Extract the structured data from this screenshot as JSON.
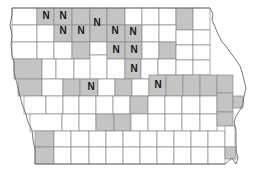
{
  "map": {
    "subject": "Iowa counties",
    "label_text": "N",
    "colors": {
      "shaded": "#c4c4c4",
      "unshaded": "#ffffff",
      "border": "#8a8a8a",
      "label": "#1a1a1a"
    },
    "counties": [
      {
        "x": 12,
        "y": 8,
        "w": 25,
        "h": 17,
        "shaded": false
      },
      {
        "x": 37,
        "y": 8,
        "w": 17,
        "h": 17,
        "shaded": true,
        "label": "N"
      },
      {
        "x": 54,
        "y": 8,
        "w": 18,
        "h": 17,
        "shaded": true,
        "label": "N"
      },
      {
        "x": 72,
        "y": 8,
        "w": 18,
        "h": 17,
        "shaded": true
      },
      {
        "x": 90,
        "y": 8,
        "w": 17,
        "h": 17,
        "shaded": true
      },
      {
        "x": 107,
        "y": 8,
        "w": 18,
        "h": 17,
        "shaded": true
      },
      {
        "x": 125,
        "y": 8,
        "w": 17,
        "h": 17,
        "shaded": false
      },
      {
        "x": 142,
        "y": 8,
        "w": 17,
        "h": 17,
        "shaded": false
      },
      {
        "x": 159,
        "y": 8,
        "w": 17,
        "h": 17,
        "shaded": false
      },
      {
        "x": 176,
        "y": 8,
        "w": 17,
        "h": 22,
        "shaded": true
      },
      {
        "x": 193,
        "y": 8,
        "w": 17,
        "h": 22,
        "shaded": false
      },
      {
        "x": 12,
        "y": 25,
        "w": 25,
        "h": 17,
        "shaded": false
      },
      {
        "x": 37,
        "y": 25,
        "w": 17,
        "h": 17,
        "shaded": false
      },
      {
        "x": 54,
        "y": 25,
        "w": 18,
        "h": 17,
        "shaded": true,
        "label": "N"
      },
      {
        "x": 72,
        "y": 25,
        "w": 18,
        "h": 17,
        "shaded": true,
        "label": "N"
      },
      {
        "x": 90,
        "y": 25,
        "w": 17,
        "h": 17,
        "shaded": true
      },
      {
        "x": 107,
        "y": 25,
        "w": 18,
        "h": 17,
        "shaded": true,
        "label": "N"
      },
      {
        "x": 125,
        "y": 25,
        "w": 17,
        "h": 17,
        "shaded": true,
        "label": "N"
      },
      {
        "x": 142,
        "y": 25,
        "w": 17,
        "h": 17,
        "shaded": false
      },
      {
        "x": 159,
        "y": 25,
        "w": 17,
        "h": 17,
        "shaded": false
      },
      {
        "x": 176,
        "y": 30,
        "w": 17,
        "h": 15,
        "shaded": false
      },
      {
        "x": 193,
        "y": 30,
        "w": 17,
        "h": 15,
        "shaded": false
      },
      {
        "x": 12,
        "y": 42,
        "w": 25,
        "h": 17,
        "shaded": false
      },
      {
        "x": 37,
        "y": 42,
        "w": 17,
        "h": 17,
        "shaded": false
      },
      {
        "x": 54,
        "y": 42,
        "w": 18,
        "h": 17,
        "shaded": false
      },
      {
        "x": 72,
        "y": 42,
        "w": 18,
        "h": 17,
        "shaded": true
      },
      {
        "x": 90,
        "y": 42,
        "w": 17,
        "h": 13,
        "shaded": false
      },
      {
        "x": 107,
        "y": 42,
        "w": 18,
        "h": 17,
        "shaded": true
      },
      {
        "x": 125,
        "y": 42,
        "w": 17,
        "h": 17,
        "shaded": true,
        "label": "N"
      },
      {
        "x": 142,
        "y": 42,
        "w": 17,
        "h": 17,
        "shaded": false
      },
      {
        "x": 159,
        "y": 42,
        "w": 17,
        "h": 17,
        "shaded": true
      },
      {
        "x": 176,
        "y": 45,
        "w": 17,
        "h": 15,
        "shaded": false
      },
      {
        "x": 193,
        "y": 45,
        "w": 17,
        "h": 15,
        "shaded": false
      },
      {
        "x": 14,
        "y": 59,
        "w": 28,
        "h": 20,
        "shaded": true
      },
      {
        "x": 42,
        "y": 59,
        "w": 14,
        "h": 20,
        "shaded": false
      },
      {
        "x": 56,
        "y": 59,
        "w": 18,
        "h": 20,
        "shaded": false
      },
      {
        "x": 74,
        "y": 59,
        "w": 17,
        "h": 20,
        "shaded": false
      },
      {
        "x": 90,
        "y": 55,
        "w": 17,
        "h": 24,
        "shaded": false
      },
      {
        "x": 107,
        "y": 59,
        "w": 18,
        "h": 20,
        "shaded": false
      },
      {
        "x": 125,
        "y": 59,
        "w": 16,
        "h": 20,
        "shaded": true,
        "label": "N"
      },
      {
        "x": 141,
        "y": 59,
        "w": 17,
        "h": 20,
        "shaded": false
      },
      {
        "x": 158,
        "y": 59,
        "w": 18,
        "h": 16,
        "shaded": false
      },
      {
        "x": 176,
        "y": 60,
        "w": 17,
        "h": 15,
        "shaded": false
      },
      {
        "x": 193,
        "y": 60,
        "w": 17,
        "h": 15,
        "shaded": false
      },
      {
        "x": 18,
        "y": 79,
        "w": 24,
        "h": 17,
        "shaded": true
      },
      {
        "x": 42,
        "y": 79,
        "w": 21,
        "h": 17,
        "shaded": false
      },
      {
        "x": 63,
        "y": 79,
        "w": 17,
        "h": 17,
        "shaded": true
      },
      {
        "x": 80,
        "y": 79,
        "w": 18,
        "h": 17,
        "shaded": true,
        "label": "N"
      },
      {
        "x": 98,
        "y": 79,
        "w": 17,
        "h": 17,
        "shaded": false
      },
      {
        "x": 115,
        "y": 79,
        "w": 17,
        "h": 17,
        "shaded": true
      },
      {
        "x": 132,
        "y": 79,
        "w": 17,
        "h": 17,
        "shaded": false
      },
      {
        "x": 149,
        "y": 75,
        "w": 17,
        "h": 21,
        "shaded": true,
        "label": "N"
      },
      {
        "x": 166,
        "y": 75,
        "w": 17,
        "h": 21,
        "shaded": true
      },
      {
        "x": 183,
        "y": 75,
        "w": 17,
        "h": 21,
        "shaded": true
      },
      {
        "x": 200,
        "y": 75,
        "w": 17,
        "h": 21,
        "shaded": true
      },
      {
        "x": 217,
        "y": 75,
        "w": 16,
        "h": 18,
        "shaded": true
      },
      {
        "x": 24,
        "y": 96,
        "w": 22,
        "h": 18,
        "shaded": false
      },
      {
        "x": 46,
        "y": 96,
        "w": 17,
        "h": 18,
        "shaded": false
      },
      {
        "x": 63,
        "y": 96,
        "w": 16,
        "h": 18,
        "shaded": false
      },
      {
        "x": 79,
        "y": 96,
        "w": 17,
        "h": 18,
        "shaded": false
      },
      {
        "x": 96,
        "y": 96,
        "w": 17,
        "h": 18,
        "shaded": false
      },
      {
        "x": 113,
        "y": 96,
        "w": 17,
        "h": 18,
        "shaded": false
      },
      {
        "x": 130,
        "y": 96,
        "w": 18,
        "h": 18,
        "shaded": true
      },
      {
        "x": 148,
        "y": 96,
        "w": 17,
        "h": 18,
        "shaded": false
      },
      {
        "x": 165,
        "y": 96,
        "w": 17,
        "h": 18,
        "shaded": false
      },
      {
        "x": 182,
        "y": 96,
        "w": 18,
        "h": 18,
        "shaded": false
      },
      {
        "x": 200,
        "y": 96,
        "w": 17,
        "h": 18,
        "shaded": false
      },
      {
        "x": 217,
        "y": 93,
        "w": 16,
        "h": 19,
        "shaded": true
      },
      {
        "x": 233,
        "y": 96,
        "w": 10,
        "h": 12,
        "shaded": true
      },
      {
        "x": 30,
        "y": 114,
        "w": 32,
        "h": 17,
        "shaded": false
      },
      {
        "x": 62,
        "y": 114,
        "w": 17,
        "h": 17,
        "shaded": false
      },
      {
        "x": 79,
        "y": 114,
        "w": 17,
        "h": 17,
        "shaded": false
      },
      {
        "x": 96,
        "y": 114,
        "w": 18,
        "h": 17,
        "shaded": true
      },
      {
        "x": 114,
        "y": 114,
        "w": 17,
        "h": 17,
        "shaded": true
      },
      {
        "x": 131,
        "y": 114,
        "w": 17,
        "h": 17,
        "shaded": false
      },
      {
        "x": 148,
        "y": 114,
        "w": 17,
        "h": 17,
        "shaded": false
      },
      {
        "x": 165,
        "y": 114,
        "w": 17,
        "h": 17,
        "shaded": false
      },
      {
        "x": 182,
        "y": 114,
        "w": 18,
        "h": 17,
        "shaded": false
      },
      {
        "x": 200,
        "y": 114,
        "w": 17,
        "h": 17,
        "shaded": false
      },
      {
        "x": 217,
        "y": 112,
        "w": 16,
        "h": 14,
        "shaded": true
      },
      {
        "x": 35,
        "y": 131,
        "w": 19,
        "h": 16,
        "shaded": true
      },
      {
        "x": 54,
        "y": 131,
        "w": 17,
        "h": 16,
        "shaded": false
      },
      {
        "x": 71,
        "y": 131,
        "w": 18,
        "h": 16,
        "shaded": false
      },
      {
        "x": 89,
        "y": 131,
        "w": 17,
        "h": 16,
        "shaded": false
      },
      {
        "x": 106,
        "y": 131,
        "w": 17,
        "h": 16,
        "shaded": false
      },
      {
        "x": 123,
        "y": 131,
        "w": 17,
        "h": 16,
        "shaded": false
      },
      {
        "x": 140,
        "y": 131,
        "w": 17,
        "h": 16,
        "shaded": false
      },
      {
        "x": 157,
        "y": 131,
        "w": 17,
        "h": 16,
        "shaded": false
      },
      {
        "x": 174,
        "y": 131,
        "w": 17,
        "h": 16,
        "shaded": false
      },
      {
        "x": 191,
        "y": 131,
        "w": 17,
        "h": 16,
        "shaded": false
      },
      {
        "x": 208,
        "y": 131,
        "w": 17,
        "h": 16,
        "shaded": false
      },
      {
        "x": 225,
        "y": 126,
        "w": 10,
        "h": 21,
        "shaded": false
      },
      {
        "x": 35,
        "y": 147,
        "w": 19,
        "h": 17,
        "shaded": true
      },
      {
        "x": 54,
        "y": 147,
        "w": 17,
        "h": 17,
        "shaded": false
      },
      {
        "x": 71,
        "y": 147,
        "w": 18,
        "h": 17,
        "shaded": false
      },
      {
        "x": 89,
        "y": 147,
        "w": 17,
        "h": 17,
        "shaded": false
      },
      {
        "x": 106,
        "y": 147,
        "w": 17,
        "h": 17,
        "shaded": false
      },
      {
        "x": 123,
        "y": 147,
        "w": 17,
        "h": 17,
        "shaded": false
      },
      {
        "x": 140,
        "y": 147,
        "w": 17,
        "h": 17,
        "shaded": false
      },
      {
        "x": 157,
        "y": 147,
        "w": 17,
        "h": 17,
        "shaded": false
      },
      {
        "x": 174,
        "y": 147,
        "w": 17,
        "h": 17,
        "shaded": false
      },
      {
        "x": 191,
        "y": 147,
        "w": 17,
        "h": 17,
        "shaded": false
      },
      {
        "x": 208,
        "y": 147,
        "w": 17,
        "h": 17,
        "shaded": false
      },
      {
        "x": 225,
        "y": 147,
        "w": 11,
        "h": 12,
        "shaded": true
      }
    ],
    "labels": [
      {
        "x": 46,
        "y": 15,
        "text": "N"
      },
      {
        "x": 63,
        "y": 15,
        "text": "N"
      },
      {
        "x": 97,
        "y": 22,
        "text": "N"
      },
      {
        "x": 63,
        "y": 30,
        "text": "N"
      },
      {
        "x": 81,
        "y": 30,
        "text": "N"
      },
      {
        "x": 115,
        "y": 30,
        "text": "N"
      },
      {
        "x": 133,
        "y": 31,
        "text": "N"
      },
      {
        "x": 116,
        "y": 49,
        "text": "N"
      },
      {
        "x": 134,
        "y": 49,
        "text": "N"
      },
      {
        "x": 134,
        "y": 68,
        "text": "N"
      },
      {
        "x": 91,
        "y": 86,
        "text": "N"
      },
      {
        "x": 158,
        "y": 84,
        "text": "N"
      }
    ]
  }
}
